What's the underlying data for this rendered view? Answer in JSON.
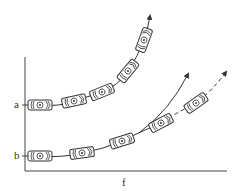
{
  "diagram": {
    "type": "motion-paths",
    "axes": {
      "x_label": "f",
      "y_ticks": [
        {
          "label": "a",
          "y": 105
        },
        {
          "label": "b",
          "y": 156
        }
      ]
    },
    "paths": [
      {
        "name": "path-a",
        "style": "solid",
        "cars": [
          {
            "x": 40,
            "y": 105,
            "angle": 0
          },
          {
            "x": 74,
            "y": 101,
            "angle": -12
          },
          {
            "x": 102,
            "y": 92,
            "angle": -22
          },
          {
            "x": 128,
            "y": 71,
            "angle": -50
          },
          {
            "x": 144,
            "y": 40,
            "angle": -70
          }
        ],
        "arrow_to": {
          "x": 150,
          "y": 14
        }
      },
      {
        "name": "path-b",
        "style": "solid-then-dashed",
        "cars": [
          {
            "x": 40,
            "y": 156,
            "angle": 0
          },
          {
            "x": 82,
            "y": 153,
            "angle": -8
          },
          {
            "x": 122,
            "y": 141,
            "angle": -18
          },
          {
            "x": 161,
            "y": 123,
            "angle": -28
          },
          {
            "x": 196,
            "y": 103,
            "angle": -35
          }
        ],
        "arrow_to": {
          "x": 226,
          "y": 72
        }
      }
    ],
    "curved_arrow": {
      "from": {
        "x": 140,
        "y": 130
      },
      "to": {
        "x": 188,
        "y": 73
      }
    },
    "colors": {
      "line": "#333333",
      "car_fill": "#ffffff"
    }
  }
}
